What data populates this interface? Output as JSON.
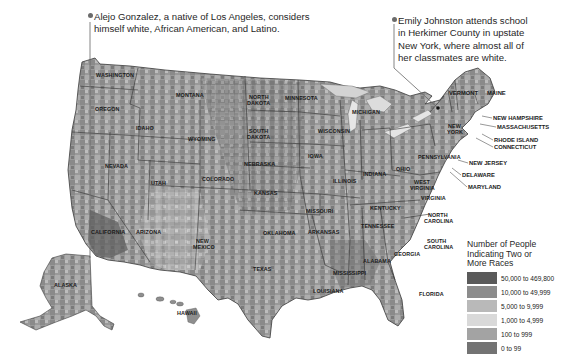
{
  "callouts": [
    {
      "id": "left",
      "text_line1": "Alejo Gonzalez, a native of Los Angeles, considers",
      "text_line2": "himself white, African American, and Latino."
    },
    {
      "id": "right",
      "text_line1": "Emily Johnston attends school",
      "text_line2": "in Herkimer County in upstate",
      "text_line3": "New York, where almost all of",
      "text_line4": "her classmates are white."
    }
  ],
  "legend": {
    "title_line1": "Number of People",
    "title_line2": "Indicating Two or",
    "title_line3": "More Races",
    "items": [
      {
        "label": "50,000 to 469,800",
        "color": "#5a5a5a"
      },
      {
        "label": "10,000 to 49,999",
        "color": "#8c8c8c"
      },
      {
        "label": "5,000 to 9,999",
        "color": "#b9b9b9"
      },
      {
        "label": "1,000 to 4,999",
        "color": "#d9d9d9"
      },
      {
        "label": "100 to 999",
        "color": "#a3a3a3"
      },
      {
        "label": "0 to 99",
        "color": "#737373"
      }
    ]
  },
  "states": {
    "washington": "WASHINGTON",
    "oregon": "OREGON",
    "idaho": "IDAHO",
    "montana": "MONTANA",
    "wyoming": "WYOMING",
    "nevada": "NEVADA",
    "utah": "UTAH",
    "colorado": "COLORADO",
    "california": "CALIFORNIA",
    "arizona": "ARIZONA",
    "new_mexico_1": "NEW",
    "new_mexico_2": "MEXICO",
    "north_dakota_1": "NORTH",
    "north_dakota_2": "DAKOTA",
    "south_dakota_1": "SOUTH",
    "south_dakota_2": "DAKOTA",
    "nebraska": "NEBRASKA",
    "kansas": "KANSAS",
    "oklahoma": "OKLAHOMA",
    "texas": "TEXAS",
    "minnesota": "MINNESOTA",
    "iowa": "IOWA",
    "missouri": "MISSOURI",
    "arkansas": "ARKANSAS",
    "louisiana": "LOUISIANA",
    "wisconsin": "WISCONSIN",
    "illinois": "ILLINOIS",
    "michigan": "MICHIGAN",
    "indiana": "INDIANA",
    "ohio": "OHIO",
    "kentucky": "KENTUCKY",
    "tennessee": "TENNESSEE",
    "mississippi": "MISSISSIPPI",
    "alabama": "ALABAMA",
    "georgia": "GEORGIA",
    "florida": "FLORIDA",
    "south_carolina_1": "SOUTH",
    "south_carolina_2": "CAROLINA",
    "north_carolina_1": "NORTH",
    "north_carolina_2": "CAROLINA",
    "virginia": "VIRGINIA",
    "west_virginia_1": "WEST",
    "west_virginia_2": "VIRGINIA",
    "pennsylvania": "PENNSYLVANIA",
    "new_york_1": "NEW",
    "new_york_2": "YORK",
    "vermont": "VERMONT",
    "maine": "MAINE",
    "new_hampshire": "NEW HAMPSHIRE",
    "massachusetts": "MASSACHUSETTS",
    "rhode_island": "RHODE ISLAND",
    "connecticut": "CONNECTICUT",
    "new_jersey": "NEW JERSEY",
    "delaware": "DELAWARE",
    "maryland": "MARYLAND",
    "alaska": "ALASKA",
    "hawaii": "HAWAII"
  }
}
